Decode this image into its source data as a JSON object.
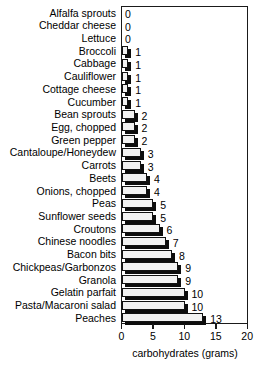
{
  "chart_data": {
    "type": "bar",
    "orientation": "horizontal",
    "title": "",
    "xlabel": "carbohydrates (grams)",
    "ylabel": "",
    "xlim": [
      0,
      20
    ],
    "xticks": [
      0,
      5,
      10,
      15,
      20
    ],
    "xtick_labels": [
      "0",
      "5",
      "10",
      "15",
      "20"
    ],
    "grid": false,
    "legend": null,
    "value_labels_shown": true,
    "categories": [
      "Alfalfa sprouts",
      "Cheddar cheese",
      "Lettuce",
      "Broccoli",
      "Cabbage",
      "Cauliflower",
      "Cottage cheese",
      "Cucumber",
      "Bean sprouts",
      "Egg, chopped",
      "Green pepper",
      "Cantaloupe/Honeydew",
      "Carrots",
      "Beets",
      "Onions, chopped",
      "Peas",
      "Sunflower seeds",
      "Croutons",
      "Chinese noodles",
      "Bacon bits",
      "Chickpeas/Garbonzos",
      "Granola",
      "Gelatin parfait",
      "Pasta/Macaroni salad",
      "Peaches"
    ],
    "values": [
      0,
      0,
      0,
      1,
      1,
      1,
      1,
      1,
      2,
      2,
      2,
      3,
      3,
      4,
      4,
      5,
      5,
      6,
      7,
      8,
      9,
      9,
      10,
      10,
      13
    ],
    "value_labels": [
      "0",
      "0",
      "0",
      "1",
      "1",
      "1",
      "1",
      "1",
      "2",
      "2",
      "2",
      "3",
      "3",
      "4",
      "4",
      "5",
      "5",
      "6",
      "7",
      "8",
      "9",
      "9",
      "10",
      "10",
      "13"
    ]
  },
  "colors": {
    "bar_face": "#f2f2f2",
    "bar_shadow": "#0d0d0d",
    "outline": "#121212",
    "frame": "#1a1a1a",
    "background": "#ffffff",
    "text": "#000000"
  }
}
